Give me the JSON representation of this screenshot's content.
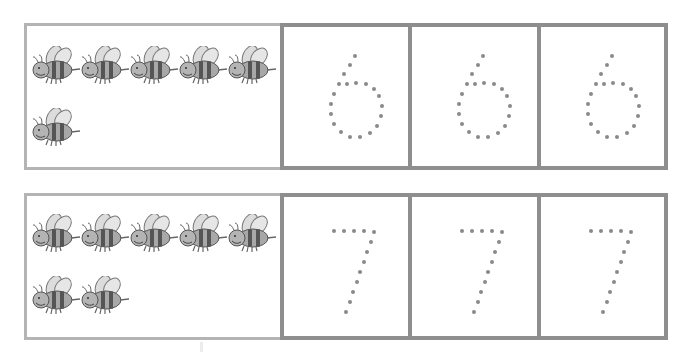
{
  "worksheet": {
    "type": "number-tracing",
    "rows": [
      {
        "number": "6",
        "bee_count": 6,
        "bees_per_line": 5,
        "tracing_boxes": 3,
        "trace_glyph": "6"
      },
      {
        "number": "7",
        "bee_count": 7,
        "bees_per_line": 5,
        "tracing_boxes": 3,
        "trace_glyph": "7"
      }
    ],
    "colors": {
      "count_box_border": "#b4b4b4",
      "trace_box_border": "#8e8e8e",
      "dot": "#8a8a8a",
      "bee_body": "#9a9a9a",
      "bee_stripe": "#555555",
      "bee_wing": "#d8d8d8"
    },
    "icons": {
      "counter": "bee-icon",
      "trace": "dotted-digit"
    }
  }
}
